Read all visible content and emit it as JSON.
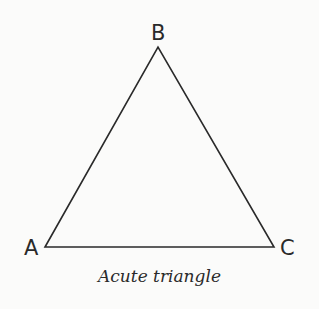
{
  "diagram": {
    "caption": "Acute triangle",
    "stroke_color": "#2a2a2a",
    "vertices": [
      {
        "label": "A",
        "x": 45,
        "y": 247
      },
      {
        "label": "B",
        "x": 158,
        "y": 47
      },
      {
        "label": "C",
        "x": 274,
        "y": 247
      }
    ]
  }
}
